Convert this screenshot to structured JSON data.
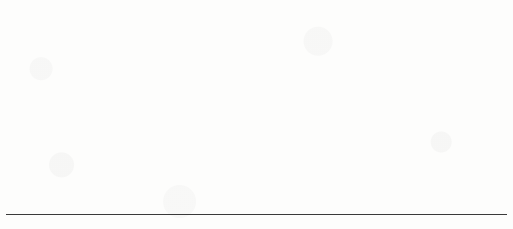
{
  "chart_data": {
    "type": "line",
    "xlabel": "",
    "ylabel": "",
    "categories": [
      "2011",
      "2012",
      "2013",
      "2014",
      "2015",
      "2016",
      "2017",
      "2018"
    ],
    "values": [
      416,
      229,
      205,
      146,
      99,
      56,
      51,
      24
    ],
    "yticks": [
      "0",
      "50",
      "100",
      "150",
      "200",
      "250",
      "300",
      "350",
      "400",
      "450"
    ],
    "ylim": [
      0,
      450
    ],
    "grid": true,
    "legend": false,
    "style_3d": true,
    "series_color": "#262626"
  },
  "page": {
    "background_color": "#fdfdfc",
    "text_color": "#231f20",
    "rule_color": "#3a3a3a"
  }
}
